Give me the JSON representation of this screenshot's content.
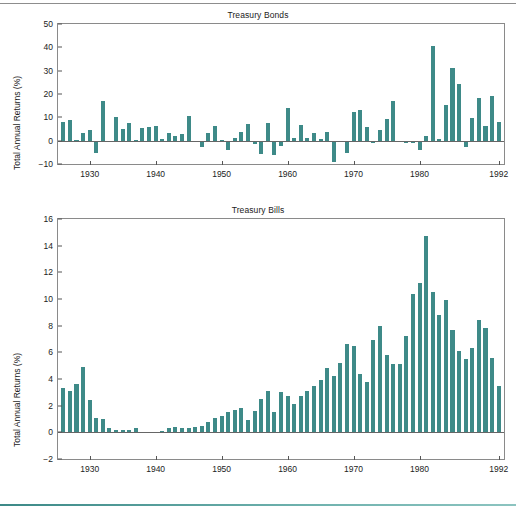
{
  "figure": {
    "divider_top_color": "#8d8d8d",
    "divider_bottom_color": "#3c8987",
    "bar_color": "#3e8a88",
    "axis_color": "#8a8a8a"
  },
  "charts": [
    {
      "id": "bonds",
      "title": "Treasury Bonds",
      "ylabel": "Total Annual Returns (%)",
      "xlabel": "",
      "yticks": [
        "50",
        "40",
        "30",
        "20",
        "10",
        "0",
        "-10"
      ],
      "xticks": [
        "1930",
        "1940",
        "1950",
        "1960",
        "1970",
        "1980",
        "1992"
      ]
    },
    {
      "id": "bills",
      "title": "Treasury Bills",
      "ylabel": "Total Annual Returns (%)",
      "xlabel": "",
      "yticks": [
        "16",
        "14",
        "12",
        "10",
        "8",
        "6",
        "4",
        "2",
        "0",
        "-2"
      ],
      "xticks": [
        "1930",
        "1940",
        "1950",
        "1960",
        "1970",
        "1980",
        "1992"
      ]
    }
  ],
  "chart_data": [
    {
      "type": "bar",
      "id": "bonds",
      "title": "Treasury Bonds",
      "xlabel": "",
      "ylabel": "Total Annual Returns (%)",
      "ylim": [
        -10,
        50
      ],
      "xlim": [
        1925.2,
        1992.8
      ],
      "ytick_values": [
        -10,
        0,
        10,
        20,
        30,
        40,
        50
      ],
      "xtick_values": [
        1930,
        1940,
        1950,
        1960,
        1970,
        1980,
        1992
      ],
      "grid": false,
      "legend": "none",
      "categories": [
        1926,
        1927,
        1928,
        1929,
        1930,
        1931,
        1932,
        1933,
        1934,
        1935,
        1936,
        1937,
        1938,
        1939,
        1940,
        1941,
        1942,
        1943,
        1944,
        1945,
        1946,
        1947,
        1948,
        1949,
        1950,
        1951,
        1952,
        1953,
        1954,
        1955,
        1956,
        1957,
        1958,
        1959,
        1960,
        1961,
        1962,
        1963,
        1964,
        1965,
        1966,
        1967,
        1968,
        1969,
        1970,
        1971,
        1972,
        1973,
        1974,
        1975,
        1976,
        1977,
        1978,
        1979,
        1980,
        1981,
        1982,
        1983,
        1984,
        1985,
        1986,
        1987,
        1988,
        1989,
        1990,
        1991,
        1992
      ],
      "values": [
        7.8,
        8.9,
        0.1,
        3.4,
        4.7,
        -5.3,
        16.8,
        -0.1,
        10.0,
        5.0,
        7.5,
        0.2,
        5.5,
        5.9,
        6.1,
        0.9,
        3.2,
        2.1,
        2.8,
        10.7,
        -0.1,
        -2.6,
        3.4,
        6.5,
        0.1,
        -3.9,
        1.2,
        3.6,
        7.2,
        -1.3,
        -5.6,
        7.5,
        -6.1,
        -2.3,
        13.8,
        1.0,
        6.9,
        1.2,
        3.5,
        0.7,
        3.7,
        -9.2,
        -0.3,
        -5.1,
        12.1,
        13.2,
        5.7,
        -1.1,
        4.4,
        9.2,
        16.8,
        -0.7,
        -1.2,
        -1.2,
        -4.0,
        1.9,
        40.4,
        0.7,
        15.5,
        31.0,
        24.5,
        -2.7,
        9.7,
        18.1,
        6.2,
        19.3,
        8.1
      ]
    },
    {
      "type": "bar",
      "id": "bills",
      "title": "Treasury Bills",
      "xlabel": "",
      "ylabel": "Total Annual Returns (%)",
      "ylim": [
        -2,
        16
      ],
      "xlim": [
        1925.2,
        1992.8
      ],
      "ytick_values": [
        -2,
        0,
        2,
        4,
        6,
        8,
        10,
        12,
        14,
        16
      ],
      "xtick_values": [
        1930,
        1940,
        1950,
        1960,
        1970,
        1980,
        1992
      ],
      "grid": false,
      "legend": "none",
      "categories": [
        1926,
        1927,
        1928,
        1929,
        1930,
        1931,
        1932,
        1933,
        1934,
        1935,
        1936,
        1937,
        1938,
        1939,
        1940,
        1941,
        1942,
        1943,
        1944,
        1945,
        1946,
        1947,
        1948,
        1949,
        1950,
        1951,
        1952,
        1953,
        1954,
        1955,
        1956,
        1957,
        1958,
        1959,
        1960,
        1961,
        1962,
        1963,
        1964,
        1965,
        1966,
        1967,
        1968,
        1969,
        1970,
        1971,
        1972,
        1973,
        1974,
        1975,
        1976,
        1977,
        1978,
        1979,
        1980,
        1981,
        1982,
        1983,
        1984,
        1985,
        1986,
        1987,
        1988,
        1989,
        1990,
        1991,
        1992
      ],
      "values": [
        3.3,
        3.1,
        3.6,
        4.9,
        2.4,
        1.1,
        1.0,
        0.3,
        0.2,
        0.2,
        0.2,
        0.3,
        0.0,
        0.0,
        0.0,
        0.1,
        0.3,
        0.4,
        0.3,
        0.3,
        0.4,
        0.5,
        0.8,
        1.1,
        1.2,
        1.5,
        1.7,
        1.8,
        0.9,
        1.6,
        2.5,
        3.1,
        1.5,
        3.0,
        2.7,
        2.1,
        2.7,
        3.1,
        3.5,
        3.9,
        4.8,
        4.2,
        5.2,
        6.6,
        6.5,
        4.4,
        3.8,
        6.9,
        8.0,
        5.8,
        5.1,
        5.1,
        7.2,
        10.4,
        11.2,
        14.7,
        10.5,
        8.8,
        9.9,
        7.7,
        6.1,
        5.5,
        6.3,
        8.4,
        7.8,
        5.6,
        3.5
      ]
    }
  ]
}
